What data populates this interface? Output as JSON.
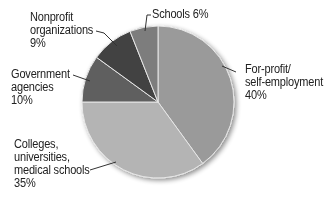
{
  "chart_data": {
    "type": "pie",
    "title": "",
    "slices": [
      {
        "label": "For-profit/ self-employment",
        "value": 40,
        "color": "#9a9a9a"
      },
      {
        "label": "Colleges, universities, medical schools",
        "value": 35,
        "color": "#b4b4b4"
      },
      {
        "label": "Government agencies",
        "value": 10,
        "color": "#5e5e5e"
      },
      {
        "label": "Nonprofit organizations",
        "value": 9,
        "color": "#434343"
      },
      {
        "label": "Schools",
        "value": 6,
        "color": "#7d7d7d"
      }
    ],
    "start_angle_deg": 0,
    "direction": "clockwise",
    "units": "%"
  },
  "labels": {
    "forprofit": {
      "line1": "For-profit/",
      "line2": "self-employment",
      "line3": "40%"
    },
    "colleges": {
      "line1": "Colleges,",
      "line2": "universities,",
      "line3": "medical schools",
      "line4": "35%"
    },
    "government": {
      "line1": "Government",
      "line2": "agencies",
      "line3": "10%"
    },
    "nonprofit": {
      "line1": "Nonprofit",
      "line2": "organizations",
      "line3": "9%"
    },
    "schools": {
      "line1": "Schools 6%"
    }
  }
}
